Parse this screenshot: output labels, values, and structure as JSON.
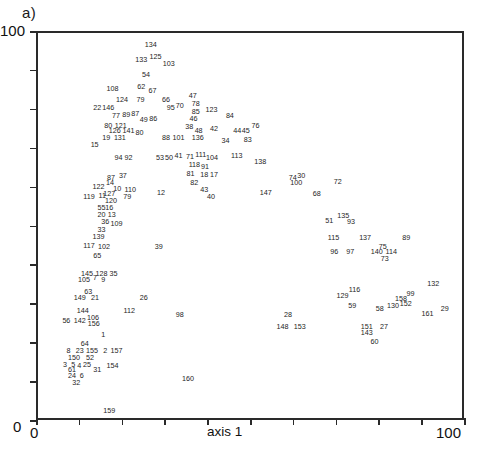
{
  "panel": {
    "label": "a)"
  },
  "axes": {
    "x_title": "axis 1",
    "y_title": "axis 2",
    "x_min_label": "0",
    "x_max_label": "100",
    "y_min_label": "0",
    "y_max_label": "100"
  },
  "chart_data": {
    "type": "scatter",
    "title": "a)",
    "xlabel": "axis 1",
    "ylabel": "axis 2",
    "xlim": [
      0,
      100
    ],
    "ylim": [
      0,
      100
    ],
    "grid": false,
    "legend": null,
    "marker_style": "text-label-only",
    "note": "Each data point is rendered as its numeric sample ID label; no plotting symbol is drawn.",
    "x_ticks": [
      0,
      10,
      20,
      30,
      40,
      50,
      60,
      70,
      80,
      90,
      100
    ],
    "x_tick_labels": [
      "0",
      "",
      "",
      "",
      "",
      "",
      "",
      "",
      "",
      "",
      "100"
    ],
    "y_ticks": [
      0,
      10,
      20,
      30,
      40,
      50,
      60,
      70,
      80,
      90,
      100
    ],
    "y_tick_labels": [
      "0",
      "",
      "",
      "",
      "",
      "",
      "",
      "",
      "",
      "",
      "100"
    ],
    "points": [
      {
        "label": "134",
        "x": 26.8,
        "y": 96.4
      },
      {
        "label": "133",
        "x": 24.6,
        "y": 92.6
      },
      {
        "label": "125",
        "x": 27.9,
        "y": 93.3
      },
      {
        "label": "103",
        "x": 31.0,
        "y": 91.5
      },
      {
        "label": "54",
        "x": 25.7,
        "y": 88.7
      },
      {
        "label": "108",
        "x": 17.9,
        "y": 85.1
      },
      {
        "label": "62",
        "x": 24.6,
        "y": 85.6
      },
      {
        "label": "67",
        "x": 27.2,
        "y": 84.6
      },
      {
        "label": "124",
        "x": 20.1,
        "y": 82.3
      },
      {
        "label": "79",
        "x": 24.4,
        "y": 82.3
      },
      {
        "label": "66",
        "x": 30.4,
        "y": 82.3
      },
      {
        "label": "47",
        "x": 36.6,
        "y": 83.3
      },
      {
        "label": "78",
        "x": 37.3,
        "y": 81.3
      },
      {
        "label": "22",
        "x": 14.3,
        "y": 80.2
      },
      {
        "label": "146",
        "x": 16.9,
        "y": 80.2
      },
      {
        "label": "95",
        "x": 31.5,
        "y": 80.2
      },
      {
        "label": "70",
        "x": 33.6,
        "y": 80.7
      },
      {
        "label": "85",
        "x": 37.3,
        "y": 79.2
      },
      {
        "label": "123",
        "x": 41.0,
        "y": 79.7
      },
      {
        "label": "77",
        "x": 18.7,
        "y": 78.1
      },
      {
        "label": "89",
        "x": 21.1,
        "y": 78.4
      },
      {
        "label": "87",
        "x": 23.2,
        "y": 78.6
      },
      {
        "label": "49",
        "x": 25.2,
        "y": 77.0
      },
      {
        "label": "86",
        "x": 27.4,
        "y": 77.3
      },
      {
        "label": "46",
        "x": 36.8,
        "y": 77.3
      },
      {
        "label": "84",
        "x": 45.3,
        "y": 78.1
      },
      {
        "label": "80",
        "x": 16.9,
        "y": 75.7
      },
      {
        "label": "121",
        "x": 19.8,
        "y": 75.7
      },
      {
        "label": "38",
        "x": 35.8,
        "y": 75.2
      },
      {
        "label": "48",
        "x": 38.0,
        "y": 74.4
      },
      {
        "label": "42",
        "x": 41.6,
        "y": 74.7
      },
      {
        "label": "76",
        "x": 51.3,
        "y": 75.7
      },
      {
        "label": "126",
        "x": 18.4,
        "y": 74.2
      },
      {
        "label": "141",
        "x": 21.6,
        "y": 74.2
      },
      {
        "label": "80b",
        "x": 24.2,
        "y": 73.9
      },
      {
        "label": "44",
        "x": 47.0,
        "y": 74.2
      },
      {
        "label": "45",
        "x": 49.0,
        "y": 74.2
      },
      {
        "label": "19",
        "x": 16.4,
        "y": 72.4
      },
      {
        "label": "131",
        "x": 19.6,
        "y": 72.4
      },
      {
        "label": "88",
        "x": 30.4,
        "y": 72.4
      },
      {
        "label": "101",
        "x": 33.3,
        "y": 72.4
      },
      {
        "label": "136",
        "x": 37.8,
        "y": 72.4
      },
      {
        "label": "34",
        "x": 44.3,
        "y": 71.6
      },
      {
        "label": "83",
        "x": 49.5,
        "y": 71.9
      },
      {
        "label": "15",
        "x": 13.7,
        "y": 70.6
      },
      {
        "label": "94",
        "x": 19.3,
        "y": 67.3
      },
      {
        "label": "92",
        "x": 21.6,
        "y": 67.3
      },
      {
        "label": "53",
        "x": 29.0,
        "y": 67.3
      },
      {
        "label": "50",
        "x": 31.1,
        "y": 67.3
      },
      {
        "label": "41",
        "x": 33.3,
        "y": 67.8
      },
      {
        "label": "71",
        "x": 36.0,
        "y": 67.6
      },
      {
        "label": "111",
        "x": 38.5,
        "y": 68.1
      },
      {
        "label": "104",
        "x": 41.1,
        "y": 67.3
      },
      {
        "label": "113",
        "x": 46.9,
        "y": 67.8
      },
      {
        "label": "138",
        "x": 52.4,
        "y": 66.2
      },
      {
        "label": "118",
        "x": 37.0,
        "y": 65.6
      },
      {
        "label": "91",
        "x": 39.5,
        "y": 65.1
      },
      {
        "label": "81",
        "x": 36.1,
        "y": 63.3
      },
      {
        "label": "18",
        "x": 39.3,
        "y": 63.1
      },
      {
        "label": "17",
        "x": 41.6,
        "y": 63.1
      },
      {
        "label": "87b",
        "x": 17.5,
        "y": 62.3
      },
      {
        "label": "37",
        "x": 20.3,
        "y": 62.6
      },
      {
        "label": "14",
        "x": 17.3,
        "y": 60.8
      },
      {
        "label": "122",
        "x": 14.6,
        "y": 59.8
      },
      {
        "label": "10",
        "x": 19.0,
        "y": 59.5
      },
      {
        "label": "110",
        "x": 22.0,
        "y": 59.2
      },
      {
        "label": "127",
        "x": 17.1,
        "y": 58.2
      },
      {
        "label": "82",
        "x": 37.0,
        "y": 61.0
      },
      {
        "label": "43",
        "x": 39.3,
        "y": 59.2
      },
      {
        "label": "119",
        "x": 12.4,
        "y": 57.4
      },
      {
        "label": "11",
        "x": 15.5,
        "y": 57.7
      },
      {
        "label": "79b",
        "x": 21.3,
        "y": 57.4
      },
      {
        "label": "120",
        "x": 17.5,
        "y": 56.4
      },
      {
        "label": "12",
        "x": 29.2,
        "y": 58.4
      },
      {
        "label": "40",
        "x": 40.9,
        "y": 57.4
      },
      {
        "label": "147",
        "x": 53.7,
        "y": 58.4
      },
      {
        "label": "74",
        "x": 60.0,
        "y": 62.3
      },
      {
        "label": "30",
        "x": 62.0,
        "y": 62.6
      },
      {
        "label": "100",
        "x": 60.8,
        "y": 60.8
      },
      {
        "label": "72",
        "x": 70.5,
        "y": 61.3
      },
      {
        "label": "68",
        "x": 65.6,
        "y": 58.2
      },
      {
        "label": "55",
        "x": 15.3,
        "y": 54.4
      },
      {
        "label": "16",
        "x": 17.1,
        "y": 54.4
      },
      {
        "label": "20",
        "x": 15.3,
        "y": 52.8
      },
      {
        "label": "13",
        "x": 17.7,
        "y": 52.8
      },
      {
        "label": "36",
        "x": 16.2,
        "y": 51.0
      },
      {
        "label": "109",
        "x": 18.8,
        "y": 50.4
      },
      {
        "label": "33",
        "x": 15.3,
        "y": 48.8
      },
      {
        "label": "139",
        "x": 14.6,
        "y": 47.1
      },
      {
        "label": "117",
        "x": 12.4,
        "y": 44.8
      },
      {
        "label": "102",
        "x": 15.9,
        "y": 44.5
      },
      {
        "label": "65",
        "x": 14.3,
        "y": 42.2
      },
      {
        "label": "39",
        "x": 28.7,
        "y": 44.5
      },
      {
        "label": "135",
        "x": 71.8,
        "y": 52.5
      },
      {
        "label": "51",
        "x": 68.5,
        "y": 51.2
      },
      {
        "label": "93",
        "x": 73.6,
        "y": 50.9
      },
      {
        "label": "115",
        "x": 69.5,
        "y": 46.8
      },
      {
        "label": "137",
        "x": 76.9,
        "y": 46.8
      },
      {
        "label": "89b",
        "x": 86.5,
        "y": 46.8
      },
      {
        "label": "75",
        "x": 81.0,
        "y": 44.5
      },
      {
        "label": "96",
        "x": 69.7,
        "y": 43.2
      },
      {
        "label": "97",
        "x": 73.4,
        "y": 43.2
      },
      {
        "label": "140",
        "x": 79.6,
        "y": 43.2
      },
      {
        "label": "114",
        "x": 83.0,
        "y": 43.2
      },
      {
        "label": "73",
        "x": 81.5,
        "y": 41.4
      },
      {
        "label": "145",
        "x": 11.9,
        "y": 37.6
      },
      {
        "label": "128",
        "x": 15.3,
        "y": 37.6
      },
      {
        "label": "35",
        "x": 18.1,
        "y": 37.6
      },
      {
        "label": "105",
        "x": 11.2,
        "y": 36.1
      },
      {
        "label": "7",
        "x": 13.8,
        "y": 36.4
      },
      {
        "label": "9",
        "x": 15.7,
        "y": 35.9
      },
      {
        "label": "63",
        "x": 12.2,
        "y": 32.8
      },
      {
        "label": "149",
        "x": 10.2,
        "y": 31.3
      },
      {
        "label": "21",
        "x": 13.8,
        "y": 31.3
      },
      {
        "label": "26",
        "x": 25.2,
        "y": 31.3
      },
      {
        "label": "116",
        "x": 74.4,
        "y": 33.3
      },
      {
        "label": "129",
        "x": 71.6,
        "y": 32.0
      },
      {
        "label": "99",
        "x": 87.5,
        "y": 32.3
      },
      {
        "label": "132",
        "x": 92.8,
        "y": 34.9
      },
      {
        "label": "158",
        "x": 85.3,
        "y": 31.0
      },
      {
        "label": "152",
        "x": 86.4,
        "y": 29.7
      },
      {
        "label": "130",
        "x": 83.4,
        "y": 29.2
      },
      {
        "label": "144",
        "x": 10.9,
        "y": 28.0
      },
      {
        "label": "112",
        "x": 21.8,
        "y": 28.0
      },
      {
        "label": "98",
        "x": 33.6,
        "y": 26.9
      },
      {
        "label": "59",
        "x": 73.9,
        "y": 29.2
      },
      {
        "label": "58",
        "x": 80.3,
        "y": 28.5
      },
      {
        "label": "29",
        "x": 95.5,
        "y": 28.5
      },
      {
        "label": "161",
        "x": 91.5,
        "y": 27.2
      },
      {
        "label": "56",
        "x": 7.1,
        "y": 25.4
      },
      {
        "label": "142",
        "x": 10.2,
        "y": 25.4
      },
      {
        "label": "106",
        "x": 13.3,
        "y": 26.2
      },
      {
        "label": "156",
        "x": 13.5,
        "y": 24.6
      },
      {
        "label": "28",
        "x": 58.9,
        "y": 26.9
      },
      {
        "label": "148",
        "x": 57.6,
        "y": 23.8
      },
      {
        "label": "153",
        "x": 61.6,
        "y": 23.8
      },
      {
        "label": "151",
        "x": 77.3,
        "y": 23.8
      },
      {
        "label": "27",
        "x": 81.3,
        "y": 23.8
      },
      {
        "label": "143",
        "x": 77.3,
        "y": 22.3
      },
      {
        "label": "60",
        "x": 79.1,
        "y": 20.0
      },
      {
        "label": "1",
        "x": 15.7,
        "y": 21.8
      },
      {
        "label": "64",
        "x": 11.4,
        "y": 19.5
      },
      {
        "label": "8",
        "x": 7.6,
        "y": 17.7
      },
      {
        "label": "23",
        "x": 10.2,
        "y": 17.7
      },
      {
        "label": "155",
        "x": 13.1,
        "y": 17.7
      },
      {
        "label": "2",
        "x": 16.2,
        "y": 17.7
      },
      {
        "label": "157",
        "x": 18.8,
        "y": 17.7
      },
      {
        "label": "150",
        "x": 8.9,
        "y": 15.9
      },
      {
        "label": "52",
        "x": 12.6,
        "y": 15.9
      },
      {
        "label": "3",
        "x": 6.8,
        "y": 14.1
      },
      {
        "label": "5",
        "x": 8.7,
        "y": 14.1
      },
      {
        "label": "4",
        "x": 10.1,
        "y": 13.9
      },
      {
        "label": "25",
        "x": 11.9,
        "y": 14.1
      },
      {
        "label": "154",
        "x": 17.9,
        "y": 13.9
      },
      {
        "label": "61",
        "x": 8.4,
        "y": 12.8
      },
      {
        "label": "31",
        "x": 14.3,
        "y": 12.8
      },
      {
        "label": "24",
        "x": 8.4,
        "y": 11.3
      },
      {
        "label": "6",
        "x": 10.7,
        "y": 11.3
      },
      {
        "label": "32",
        "x": 9.4,
        "y": 9.5
      },
      {
        "label": "160",
        "x": 35.5,
        "y": 10.5
      },
      {
        "label": "159",
        "x": 17.1,
        "y": 2.3
      }
    ]
  }
}
